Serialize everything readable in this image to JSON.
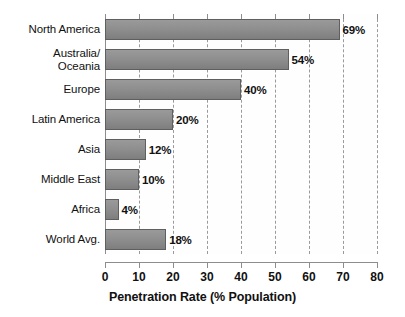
{
  "chart_data": {
    "type": "bar",
    "orientation": "horizontal",
    "title": "",
    "xlabel": "Penetration Rate (% Population)",
    "ylabel": "",
    "xlim": [
      0,
      80
    ],
    "xticks": [
      "0",
      "10",
      "20",
      "30",
      "40",
      "50",
      "60",
      "70",
      "80"
    ],
    "grid": true,
    "legend": false,
    "categories": [
      "North America",
      "Australia/\nOceania",
      "Europe",
      "Latin America",
      "Asia",
      "Middle East",
      "Africa",
      "World Avg."
    ],
    "values": [
      69,
      54,
      40,
      20,
      12,
      10,
      4,
      18
    ],
    "value_labels": [
      "69%",
      "54%",
      "40%",
      "20%",
      "12%",
      "10%",
      "4%",
      "18%"
    ],
    "bar_color": "#8f8f8f",
    "bar_border_color": "#5f5f5f",
    "grid_color": "#9a9a9a",
    "axis_color": "#8d8d8d",
    "text_color": "#111111"
  }
}
